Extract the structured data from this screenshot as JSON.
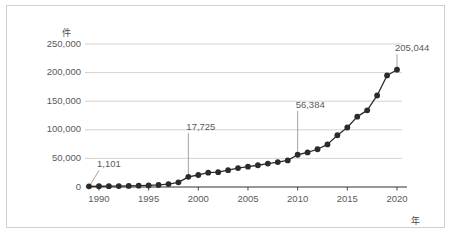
{
  "chart_data": {
    "type": "line",
    "title": "",
    "subtitle": "",
    "xlabel": "年",
    "ylabel": "件",
    "xlim": [
      1989,
      2020
    ],
    "ylim": [
      0,
      250000
    ],
    "grid": true,
    "legend": false,
    "marker": "filled-circle",
    "line_color": "#2b2b2b",
    "marker_color": "#2b2b2b",
    "grid_color": "#c8c8c8",
    "axis_color": "#333333",
    "text_color": "#5a5a5a",
    "ytick_labels": [
      "0",
      "50,000",
      "100,000",
      "150,000",
      "200,000",
      "250,000"
    ],
    "ytick_values": [
      0,
      50000,
      100000,
      150000,
      200000,
      250000
    ],
    "xtick_labels": [
      "1990",
      "1995",
      "2000",
      "2005",
      "2010",
      "2015",
      "2020"
    ],
    "xtick_values": [
      1990,
      1995,
      2000,
      2005,
      2010,
      2015,
      2020
    ],
    "x": [
      1989,
      1990,
      1991,
      1992,
      1993,
      1994,
      1995,
      1996,
      1997,
      1998,
      1999,
      2000,
      2001,
      2002,
      2003,
      2004,
      2005,
      2006,
      2007,
      2008,
      2009,
      2010,
      2011,
      2012,
      2013,
      2014,
      2015,
      2016,
      2017,
      2018,
      2019,
      2020
    ],
    "values": [
      1101,
      1300,
      1500,
      1700,
      1900,
      2300,
      2800,
      3600,
      5200,
      8200,
      17725,
      21000,
      25000,
      26000,
      29500,
      33000,
      35500,
      38000,
      41000,
      43500,
      46500,
      56384,
      60500,
      66000,
      74500,
      90500,
      104000,
      123000,
      134000,
      160000,
      195000,
      205044
    ],
    "annotations": [
      {
        "label": "1,101",
        "year": 1989,
        "value": 1101,
        "leader": "diagonal"
      },
      {
        "label": "17,725",
        "year": 1999,
        "value": 17725,
        "leader": "vertical"
      },
      {
        "label": "56,384",
        "year": 2010,
        "value": 56384,
        "leader": "vertical"
      },
      {
        "label": "205,044",
        "year": 2020,
        "value": 205044,
        "leader": "vertical"
      }
    ]
  }
}
